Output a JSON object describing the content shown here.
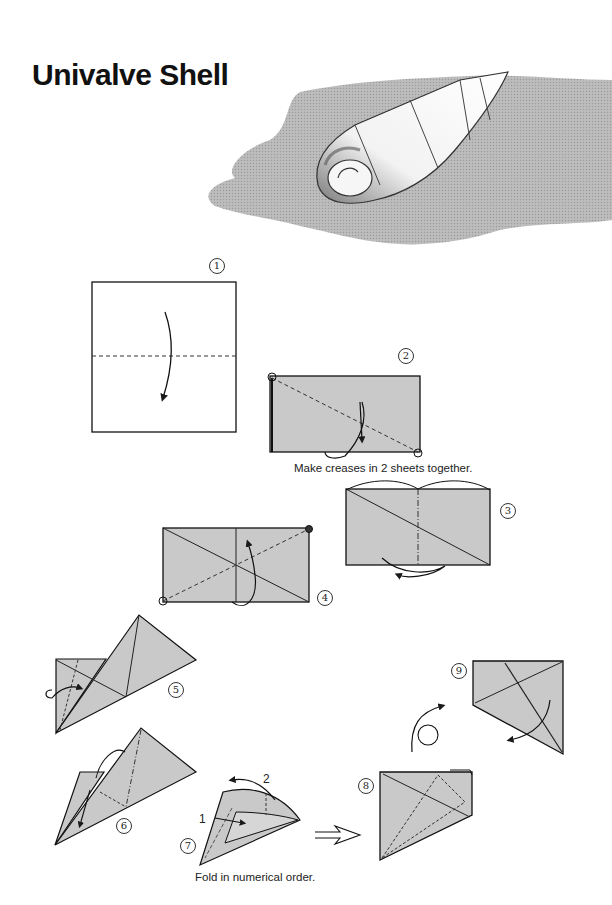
{
  "page": {
    "title": "Univalve Shell"
  },
  "hero_illustration": {
    "subject": "folded origami univalve shell on gray background"
  },
  "colors": {
    "paper_fill": "#c9c9c9",
    "backdrop_fill": "#b9b9b9",
    "line": "#1a1a1a",
    "text": "#111111"
  },
  "steps": [
    {
      "number": "1",
      "glyph": "①"
    },
    {
      "number": "2",
      "glyph": "②",
      "caption": "Make creases in 2 sheets together."
    },
    {
      "number": "3",
      "glyph": "③"
    },
    {
      "number": "4",
      "glyph": "④"
    },
    {
      "number": "5",
      "glyph": "⑤"
    },
    {
      "number": "6",
      "glyph": "⑥"
    },
    {
      "number": "7",
      "glyph": "⑦",
      "caption": "Fold in numerical order.",
      "fold_labels": [
        "1",
        "2"
      ]
    },
    {
      "number": "8",
      "glyph": "⑧"
    },
    {
      "number": "9",
      "glyph": "⑨"
    }
  ]
}
